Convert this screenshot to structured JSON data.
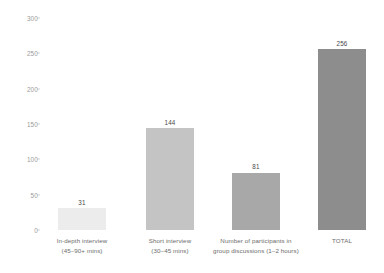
{
  "chart_data": {
    "type": "bar",
    "title": "",
    "subtitle": "",
    "xlabel": "",
    "ylabel": "",
    "ylim": [
      0,
      300
    ],
    "yticks": [
      0,
      50,
      100,
      150,
      200,
      250,
      300
    ],
    "ytick_labels": [
      "0",
      "50",
      "100",
      "150",
      "200",
      "250",
      "300"
    ],
    "grid": false,
    "legend": false,
    "orientation": "vertical",
    "background_color": "#ffffff",
    "categories": [
      "In-depth interview (45–90+ mins)",
      "Short interview (30–45 mins)",
      "Number of participants in group discussions (1–2 hours)",
      "TOTAL"
    ],
    "values": [
      31,
      144,
      81,
      256
    ],
    "value_labels": [
      "31",
      "144",
      "81",
      "256"
    ],
    "bar_colors": [
      "#ececec",
      "#c4c4c4",
      "#a8a8a8",
      "#8d8d8d"
    ],
    "bars": [
      {
        "value": 31,
        "value_label": "31",
        "color": "#ececec",
        "line1": "In-depth interview",
        "line2": "(45–90+ mins)"
      },
      {
        "value": 144,
        "value_label": "144",
        "color": "#c4c4c4",
        "line1": "Short interview",
        "line2": "(30–45 mins)"
      },
      {
        "value": 81,
        "value_label": "81",
        "color": "#a8a8a8",
        "line1": "Number of participants in",
        "line2": "group discussions (1–2 hours)"
      },
      {
        "value": 256,
        "value_label": "256",
        "color": "#8d8d8d",
        "line1": "TOTAL",
        "line2": ""
      }
    ]
  }
}
